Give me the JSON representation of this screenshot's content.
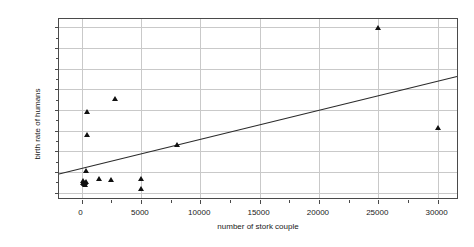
{
  "chart_data": {
    "type": "scatter",
    "title": "",
    "xlabel": "number of stork couple",
    "ylabel": "birth rate of humans",
    "xlim": [
      -1900,
      31800
    ],
    "ylim": [
      -70,
      1680
    ],
    "xticks": [
      0,
      5000,
      10000,
      15000,
      20000,
      25000,
      30000
    ],
    "xticklabels": [
      "0",
      "5000",
      "10000",
      "15000",
      "20000",
      "25000",
      "30000"
    ],
    "yticks": [
      0,
      200,
      400,
      600,
      800,
      1000,
      1200,
      1400,
      1600
    ],
    "yticklabels": [
      "0",
      "200",
      "400",
      "600",
      "800",
      "1000",
      "1200",
      "1400",
      "1600"
    ],
    "grid": true,
    "legend": false,
    "marker": "triangle",
    "marker_color": "#111111",
    "grid_color": "#c9c9c9",
    "axis_color": "#4a4a4a",
    "points": [
      {
        "x": 140,
        "y": 83
      },
      {
        "x": 140,
        "y": 100
      },
      {
        "x": 230,
        "y": 77
      },
      {
        "x": 300,
        "y": 62
      },
      {
        "x": 300,
        "y": 88
      },
      {
        "x": 380,
        "y": 95
      },
      {
        "x": 400,
        "y": 205
      },
      {
        "x": 420,
        "y": 550
      },
      {
        "x": 430,
        "y": 770
      },
      {
        "x": 1500,
        "y": 120
      },
      {
        "x": 2500,
        "y": 110
      },
      {
        "x": 2800,
        "y": 900
      },
      {
        "x": 5000,
        "y": 120
      },
      {
        "x": 5000,
        "y": 25
      },
      {
        "x": 8000,
        "y": 450
      },
      {
        "x": 25000,
        "y": 1580
      },
      {
        "x": 30000,
        "y": 620
      }
    ],
    "fit_line": {
      "name": "linear regression",
      "color": "#2b2b2b",
      "x_start": -1900,
      "y_start": 165,
      "x_end": 31800,
      "y_end": 1118
    }
  }
}
